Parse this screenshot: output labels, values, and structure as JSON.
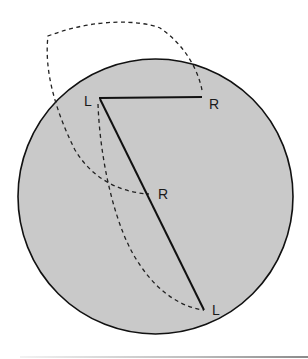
{
  "diagram": {
    "circle": {
      "cx": 155.5,
      "cy": 196.5,
      "r": 137.5,
      "fill": "#c9c9c9",
      "stroke": "#111111"
    },
    "solid_lines": [
      {
        "from": "L_top",
        "to": "R_top"
      },
      {
        "from": "L_top",
        "to": "L_bottom"
      }
    ],
    "points": {
      "L_top": {
        "label": "L",
        "x": 99,
        "y": 98
      },
      "R_top": {
        "label": "R",
        "x": 202,
        "y": 97
      },
      "R_mid": {
        "label": "R",
        "x": 149,
        "y": 194
      },
      "L_bottom": {
        "label": "L",
        "x": 204,
        "y": 310
      }
    },
    "labels": [
      {
        "id": "label-L-top",
        "text": "L"
      },
      {
        "id": "label-R-top",
        "text": "R"
      },
      {
        "id": "label-R-mid",
        "text": "R"
      },
      {
        "id": "label-L-bottom",
        "text": "L"
      }
    ],
    "dashed_paths": [
      "arc-from-R-top-looping-outside-circle-down-to-R-mid",
      "arc-from-L-top-down-to-L-bottom"
    ]
  }
}
